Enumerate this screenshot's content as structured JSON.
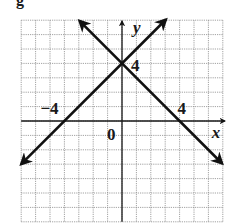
{
  "cut_label": "g",
  "chart_data": {
    "type": "line",
    "title": "",
    "xlabel": "x",
    "ylabel": "y",
    "xlim": [
      -7,
      7
    ],
    "ylim": [
      -7,
      7
    ],
    "grid": true,
    "grid_step": 1,
    "tick_labels": {
      "x": [
        {
          "value": -4,
          "label": "−4"
        },
        {
          "value": 4,
          "label": "4"
        }
      ],
      "y": [
        {
          "value": 4,
          "label": "4"
        }
      ],
      "origin": "0"
    },
    "series": [
      {
        "name": "y = x + 4",
        "slope": 1,
        "intercept": 4,
        "x_range": [
          -7,
          3.05
        ],
        "points": [
          [
            -4,
            0
          ],
          [
            0,
            4
          ]
        ]
      },
      {
        "name": "y = -x + 4",
        "slope": -1,
        "intercept": 4,
        "x_range": [
          -2.95,
          6.95
        ],
        "points": [
          [
            0,
            4
          ],
          [
            4,
            0
          ]
        ]
      }
    ],
    "intersection": [
      0,
      4
    ],
    "colors": {
      "line": "#111111",
      "grid": "#8a8a8a",
      "axis": "#1a1a1a"
    }
  }
}
